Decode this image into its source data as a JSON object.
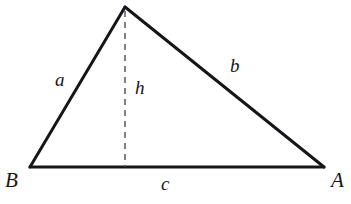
{
  "figure": {
    "kind": "geometry-diagram",
    "background_color": "#ffffff",
    "stroke_color": "#15161a",
    "dash_color": "#4a4a52",
    "solid_stroke_width": 3,
    "dashed_stroke_width": 1.4,
    "dash_pattern": "6 5"
  },
  "geometry": {
    "vertices": {
      "B": {
        "label": "B",
        "x": 30,
        "y": 167
      },
      "A": {
        "label": "A",
        "x": 324,
        "y": 167
      },
      "apex": {
        "label": "",
        "x": 125,
        "y": 7
      }
    },
    "foot_of_altitude": {
      "x": 125,
      "y": 167
    },
    "sides": [
      {
        "name": "a",
        "label": "a",
        "from": "B",
        "to": "apex"
      },
      {
        "name": "b",
        "label": "b",
        "from": "apex",
        "to": "A"
      },
      {
        "name": "c",
        "label": "c",
        "from": "B",
        "to": "A"
      }
    ],
    "altitude": {
      "name": "h",
      "label": "h",
      "style": "dashed"
    }
  },
  "labels": {
    "vertex_B": "B",
    "vertex_A": "A",
    "side_a": "a",
    "side_b": "b",
    "side_c": "c",
    "altitude_h": "h"
  }
}
